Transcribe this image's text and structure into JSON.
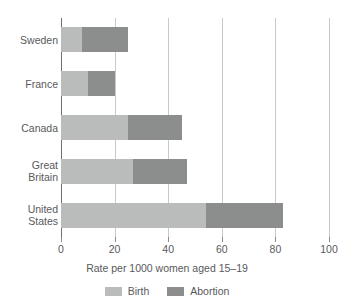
{
  "chart_data": {
    "type": "bar",
    "orientation": "horizontal",
    "stacked": true,
    "title": "",
    "xlabel": "Rate per 1000 women aged 15–19",
    "ylabel": "",
    "xlim": [
      0,
      100
    ],
    "xticks": [
      0,
      20,
      40,
      60,
      80,
      100
    ],
    "xtick_labels": [
      "0",
      "20",
      "40",
      "60",
      "80",
      "100"
    ],
    "grid": true,
    "legend_position": "bottom",
    "categories": [
      "Sweden",
      "France",
      "Canada",
      "Great\nBritain",
      "United\nStates"
    ],
    "series": [
      {
        "name": "Birth",
        "color": "#b9bcbb",
        "values": [
          8,
          10,
          25,
          27,
          54
        ]
      },
      {
        "name": "Abortion",
        "color": "#8b8e8d",
        "values": [
          17,
          10,
          20,
          20,
          29
        ]
      }
    ],
    "totals": [
      25,
      20,
      45,
      47,
      83
    ]
  },
  "legend": {
    "items": [
      {
        "label": "Birth"
      },
      {
        "label": "Abortion"
      }
    ]
  }
}
